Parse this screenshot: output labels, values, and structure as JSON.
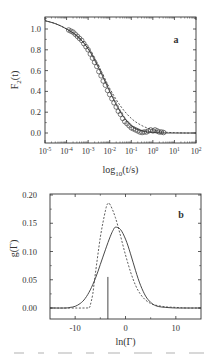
{
  "chart_data": [
    {
      "panel_label": "a",
      "type": "scatter+line",
      "title": "",
      "xlabel": "log10(t/s)",
      "ylabel": "F2(t)",
      "xscale": "log",
      "xlim_log10": [
        -5,
        2
      ],
      "ylim": [
        -0.1,
        1.11
      ],
      "x_ticks": [
        "10^-5",
        "10^-4",
        "10^-3",
        "10^-2",
        "10^-1",
        "10^0",
        "10^1",
        "10^2"
      ],
      "y_ticks": [
        "0.0",
        "0.2",
        "0.4",
        "0.6",
        "0.8",
        "1.0"
      ],
      "grid": false,
      "legend": null,
      "series": [
        {
          "name": "data (circles)",
          "style": "open-circles",
          "log10_t": [
            -3.9,
            -3.8,
            -3.7,
            -3.6,
            -3.5,
            -3.4,
            -3.3,
            -3.2,
            -3.1,
            -3.0,
            -2.9,
            -2.8,
            -2.7,
            -2.6,
            -2.5,
            -2.4,
            -2.3,
            -2.2,
            -2.1,
            -2.0,
            -1.9,
            -1.8,
            -1.7,
            -1.6,
            -1.5,
            -1.4,
            -1.3,
            -1.2,
            -1.1,
            -1.0,
            -0.9,
            -0.8,
            -0.7,
            -0.6,
            -0.5,
            -0.4,
            -0.3,
            -0.2,
            -0.1,
            0.0,
            0.1,
            0.2,
            0.3,
            0.4,
            0.5
          ],
          "values": [
            0.99,
            0.98,
            0.97,
            0.95,
            0.93,
            0.91,
            0.89,
            0.86,
            0.83,
            0.8,
            0.76,
            0.72,
            0.68,
            0.64,
            0.59,
            0.55,
            0.5,
            0.46,
            0.41,
            0.37,
            0.33,
            0.29,
            0.25,
            0.21,
            0.18,
            0.14,
            0.11,
            0.09,
            0.07,
            0.05,
            0.04,
            0.03,
            0.02,
            0.01,
            0.005,
            0.01,
            0.01,
            0.02,
            0.03,
            0.02,
            0.03,
            0.02,
            0.01,
            0.01,
            0.005
          ]
        },
        {
          "name": "fit (solid)",
          "style": "solid",
          "log10_t": [
            -5,
            -4.5,
            -4,
            -3.5,
            -3,
            -2.5,
            -2,
            -1.5,
            -1,
            -0.5,
            0,
            0.5,
            1,
            1.5,
            2
          ],
          "values": [
            1.08,
            1.05,
            1.0,
            0.93,
            0.81,
            0.62,
            0.4,
            0.2,
            0.07,
            0.02,
            0.005,
            0.0,
            0.0,
            0.0,
            0.0
          ]
        },
        {
          "name": "fit (dashed)",
          "style": "dashed",
          "log10_t": [
            -5,
            -4.5,
            -4,
            -3.5,
            -3,
            -2.5,
            -2,
            -1.5,
            -1,
            -0.5,
            0,
            0.5,
            1,
            1.5,
            2
          ],
          "values": [
            1.08,
            1.05,
            1.0,
            0.93,
            0.82,
            0.64,
            0.43,
            0.26,
            0.14,
            0.07,
            0.03,
            0.01,
            0.003,
            0.0,
            0.0
          ]
        }
      ]
    },
    {
      "panel_label": "b",
      "type": "line",
      "title": "",
      "xlabel": "ln(Γ)",
      "ylabel": "g(Γ)",
      "xlim": [
        -15,
        15
      ],
      "ylim": [
        -0.02,
        0.2
      ],
      "x_ticks": [
        "-10",
        "0",
        "10"
      ],
      "y_ticks": [
        "0.00",
        "0.05",
        "0.10",
        "0.15",
        "0.20"
      ],
      "grid": false,
      "legend": null,
      "series": [
        {
          "name": "solid",
          "style": "solid",
          "x": [
            -15,
            -12,
            -11,
            -10,
            -9,
            -8,
            -7,
            -6,
            -5,
            -4,
            -3,
            -2.5,
            -2,
            -1,
            0,
            1,
            2,
            3,
            4,
            5,
            6,
            7,
            8,
            10,
            12,
            15
          ],
          "values": [
            0.0,
            0.0,
            0.001,
            0.003,
            0.008,
            0.017,
            0.032,
            0.052,
            0.077,
            0.103,
            0.127,
            0.137,
            0.143,
            0.139,
            0.122,
            0.096,
            0.066,
            0.04,
            0.021,
            0.01,
            0.004,
            0.002,
            0.001,
            0.0,
            0.0,
            0.0
          ]
        },
        {
          "name": "dashed",
          "style": "dashed",
          "x": [
            -15,
            -8,
            -7.2,
            -7,
            -6.5,
            -6,
            -5,
            -4,
            -3.5,
            -3,
            -2,
            -1,
            0,
            1,
            2,
            3,
            4,
            5,
            6,
            8,
            10,
            12,
            15
          ],
          "values": [
            0.0,
            0.0,
            0.001,
            0.005,
            0.025,
            0.06,
            0.125,
            0.172,
            0.185,
            0.182,
            0.16,
            0.128,
            0.094,
            0.064,
            0.04,
            0.024,
            0.014,
            0.008,
            0.005,
            0.002,
            0.001,
            0.0,
            0.0
          ]
        },
        {
          "name": "vertical line",
          "style": "solid-stem",
          "x": [
            -3.5,
            -3.5
          ],
          "values": [
            -0.02,
            0.055
          ]
        }
      ]
    }
  ],
  "caption_fragment": "(illegible cropped caption text)"
}
